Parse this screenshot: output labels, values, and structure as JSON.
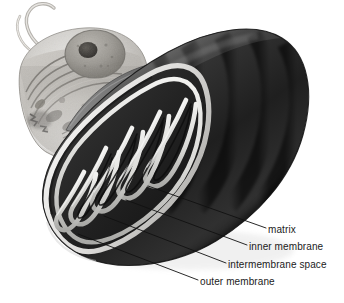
{
  "figure": {
    "background_color": "#ffffff"
  },
  "cell_inset": {
    "name": "eukaryotic cell cutaway",
    "parts": [
      "flagellum",
      "nucleus",
      "nucleolus",
      "endoplasmic reticulum",
      "cytoplasm",
      "plasma membrane",
      "organelles"
    ],
    "fill_light": "#d8d6d2",
    "fill_mid": "#a9a6a1",
    "fill_dark": "#6e6b66"
  },
  "arrow": {
    "name": "zoom-in arrow",
    "color": "#6f6f6f",
    "direction": "left-to-right curving upward"
  },
  "mitochondrion": {
    "name": "mitochondrion",
    "outer_color": "#2b2b2b",
    "membrane_color": "#e8e8e6",
    "matrix_color": "#161616",
    "cristae_count": 7
  },
  "labels": [
    {
      "id": "matrix",
      "text": "matrix"
    },
    {
      "id": "inner_membrane",
      "text": "inner membrane"
    },
    {
      "id": "intermembrane_space",
      "text": "intermembrane space"
    },
    {
      "id": "outer_membrane",
      "text": "outer membrane"
    }
  ],
  "leader_lines": {
    "color": "#111111",
    "count": 4
  }
}
